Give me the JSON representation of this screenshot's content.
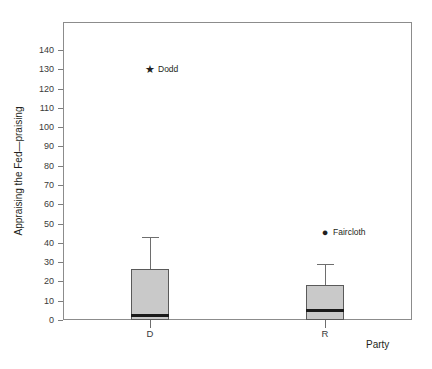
{
  "chart_data": {
    "type": "box",
    "title": "",
    "xlabel": "Party",
    "ylabel": "Appraising the Fed—praising",
    "ylim": [
      0,
      148
    ],
    "xlim": [
      0,
      2
    ],
    "grid": false,
    "legend": "none",
    "yticks": [
      0,
      10,
      20,
      30,
      40,
      50,
      60,
      70,
      80,
      90,
      100,
      110,
      120,
      130,
      140
    ],
    "ytick_labels": [
      "0",
      "10",
      "20",
      "30",
      "40",
      "50",
      "60",
      "70",
      "80",
      "90",
      "100",
      "110",
      "120",
      "130",
      "140"
    ],
    "categories": [
      "D",
      "R"
    ],
    "boxes": [
      {
        "category": "D",
        "whisker_low": 0,
        "q1": 0,
        "median": 2.5,
        "q3": 26.5,
        "whisker_high": 43,
        "x_center": 0.5
      },
      {
        "category": "R",
        "whisker_low": 0,
        "q1": 0,
        "median": 5,
        "q3": 18,
        "whisker_high": 29,
        "x_center": 1.5
      }
    ],
    "outliers": [
      {
        "label": "Dodd",
        "category": "D",
        "value": 130,
        "marker": "star",
        "marker_glyph": "★",
        "x_center": 0.5
      },
      {
        "label": "Faircloth",
        "category": "R",
        "value": 45.5,
        "marker": "circle",
        "marker_glyph": "●",
        "x_center": 1.5
      }
    ],
    "colors": {
      "box_fill": "#c9c9c9",
      "box_edge": "#5a5a5a",
      "median": "#1a1a1a",
      "whisker": "#6e6e6e",
      "frame": "#8c8c8c",
      "text": "#231f20",
      "background": "#ffffff"
    }
  }
}
